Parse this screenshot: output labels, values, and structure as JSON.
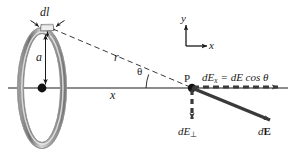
{
  "figure": {
    "colors": {
      "line": "#1a1a1a",
      "ring_outer": "#8c8c8c",
      "ring_inner": "#c9c9c9",
      "ring_highlight": "#e8e8e8",
      "vector": "#3a3a3a",
      "dashed": "#3a3a3a",
      "text": "#1a1a1a"
    },
    "labels": {
      "dl": "dl",
      "a": "a",
      "r": "r",
      "x_axis_distance": "x",
      "theta": "θ",
      "point_p": "P",
      "axis_y": "y",
      "axis_x": "x",
      "dE_parallel_eq": "dEₓ = dE cos θ",
      "dE_parallel_lhs": "dE",
      "dE_parallel_lhs_sub": "x",
      "dE_parallel_rhs": "= dE cos θ",
      "dE_perp": "dE",
      "dE_perp_sub": "⊥",
      "dE_vector": "d",
      "dE_vector_bold": "E"
    },
    "geometry": {
      "ring_center": [
        42,
        88
      ],
      "ring_rx": 21,
      "ring_ry": 57,
      "segment_dl": [
        48,
        27
      ],
      "point_p": [
        192,
        88
      ],
      "axes_origin": [
        186,
        46
      ],
      "dE_vector_tip": [
        272,
        121
      ],
      "dE_parallel_tip": [
        281,
        87
      ],
      "dE_perp_tip": [
        192,
        122
      ],
      "theta_vertex": [
        192,
        88
      ],
      "theta_arc_radius": 46
    }
  }
}
